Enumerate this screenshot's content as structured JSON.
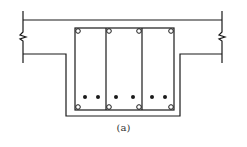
{
  "figure": {
    "caption": "(a)",
    "colors": {
      "line": "#1a1a1a",
      "background": "#ffffff"
    }
  },
  "geometry": {
    "flange": {
      "left": 23,
      "right": 222,
      "top": 20,
      "bottom": 54,
      "extent_top": 11,
      "extent_bottom": 63
    },
    "web": {
      "left": 66,
      "right": 180,
      "bottom": 116
    },
    "stirrups": {
      "left": 75,
      "right": 174,
      "top": 28,
      "bottom": 110,
      "inner_lines": [
        106,
        142
      ]
    },
    "corner_bars_open": [
      {
        "x": 78,
        "y": 31
      },
      {
        "x": 109,
        "y": 31
      },
      {
        "x": 139,
        "y": 31
      },
      {
        "x": 171,
        "y": 31
      },
      {
        "x": 78,
        "y": 107
      },
      {
        "x": 109,
        "y": 107
      },
      {
        "x": 139,
        "y": 107
      },
      {
        "x": 171,
        "y": 107
      }
    ],
    "tension_bars_filled": [
      {
        "x": 85,
        "y": 97
      },
      {
        "x": 98,
        "y": 97
      },
      {
        "x": 116,
        "y": 97
      },
      {
        "x": 133,
        "y": 97
      },
      {
        "x": 152,
        "y": 97
      },
      {
        "x": 165,
        "y": 97
      }
    ]
  }
}
